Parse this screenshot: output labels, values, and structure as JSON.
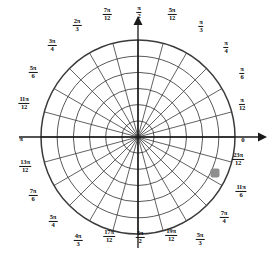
{
  "figure": {
    "type": "polar-grid",
    "center": {
      "x": 138,
      "y": 137
    },
    "outer_radius": 97,
    "circle_count": 6,
    "ray_count": 24,
    "angle_step": "pi/12",
    "colors": {
      "grid": "#3a3a3a",
      "axis": "#1a1a1a",
      "marker": "#8f8f8f",
      "background": "#ffffff"
    }
  },
  "axes": {
    "polar_axis_label": "0",
    "vertical_arrow": "up-arrow",
    "horizontal_arrow": "right-arrow"
  },
  "marker": {
    "label": "plotted-point",
    "angle": "23pi/12",
    "radius_ring": 5,
    "x": 215,
    "y": 173,
    "size": 9,
    "color": "#8f8f8f"
  },
  "angle_labels": [
    {
      "id": "a-0",
      "num": "",
      "den": "",
      "plain": "0",
      "x": 243,
      "y": 137
    },
    {
      "id": "a-pi12",
      "num": "π",
      "den": "12",
      "plain": "",
      "x": 242,
      "y": 105
    },
    {
      "id": "a-pi6",
      "num": "π",
      "den": "6",
      "plain": "",
      "x": 242,
      "y": 74
    },
    {
      "id": "a-pi4",
      "num": "π",
      "den": "4",
      "plain": "",
      "x": 226,
      "y": 48
    },
    {
      "id": "a-pi3",
      "num": "π",
      "den": "3",
      "plain": "",
      "x": 201,
      "y": 27
    },
    {
      "id": "a-5pi12",
      "num": "5π",
      "den": "12",
      "plain": "",
      "x": 172,
      "y": 15
    },
    {
      "id": "a-pi2",
      "num": "π",
      "den": "2",
      "plain": "",
      "x": 139,
      "y": 13
    },
    {
      "id": "a-7pi12",
      "num": "7π",
      "den": "12",
      "plain": "",
      "x": 107,
      "y": 15
    },
    {
      "id": "a-2pi3",
      "num": "2π",
      "den": "3",
      "plain": "",
      "x": 77,
      "y": 26
    },
    {
      "id": "a-3pi4",
      "num": "3π",
      "den": "4",
      "plain": "",
      "x": 52,
      "y": 46
    },
    {
      "id": "a-5pi6",
      "num": "5π",
      "den": "6",
      "plain": "",
      "x": 33,
      "y": 73
    },
    {
      "id": "a-11pi12",
      "num": "11π",
      "den": "12",
      "plain": "",
      "x": 24,
      "y": 104
    },
    {
      "id": "a-pi",
      "num": "",
      "den": "",
      "plain": "π",
      "x": 21,
      "y": 136
    },
    {
      "id": "a-13pi12",
      "num": "13π",
      "den": "12",
      "plain": "",
      "x": 25,
      "y": 167
    },
    {
      "id": "a-7pi6",
      "num": "7π",
      "den": "6",
      "plain": "",
      "x": 33,
      "y": 196
    },
    {
      "id": "a-5pi4",
      "num": "5π",
      "den": "4",
      "plain": "",
      "x": 53,
      "y": 222
    },
    {
      "id": "a-4pi3",
      "num": "4π",
      "den": "3",
      "plain": "",
      "x": 78,
      "y": 241
    },
    {
      "id": "a-17pi12",
      "num": "17π",
      "den": "12",
      "plain": "",
      "x": 109,
      "y": 237
    },
    {
      "id": "a-3pi2",
      "num": "3π",
      "den": "2",
      "plain": "",
      "x": 140,
      "y": 238
    },
    {
      "id": "a-19pi12",
      "num": "19π",
      "den": "12",
      "plain": "",
      "x": 171,
      "y": 236
    },
    {
      "id": "a-5pi3",
      "num": "5π",
      "den": "3",
      "plain": "",
      "x": 200,
      "y": 240
    },
    {
      "id": "a-7pi4",
      "num": "7π",
      "den": "4",
      "plain": "",
      "x": 224,
      "y": 218
    },
    {
      "id": "a-11pi6",
      "num": "11π",
      "den": "6",
      "plain": "",
      "x": 241,
      "y": 192
    },
    {
      "id": "a-23pi12",
      "num": "23π",
      "den": "12",
      "plain": "",
      "x": 238,
      "y": 160
    }
  ]
}
